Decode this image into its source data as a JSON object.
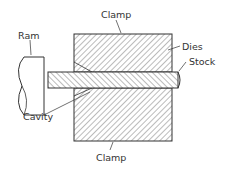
{
  "diagram": {
    "labels": {
      "ram": "Ram",
      "clamp_top": "Clamp",
      "dies": "Dies",
      "stock": "Stock",
      "cavity": "Cavity",
      "clamp_bottom": "Clamp"
    },
    "colors": {
      "line": "#333333",
      "hatch": "#555555",
      "background": "#ffffff"
    }
  }
}
